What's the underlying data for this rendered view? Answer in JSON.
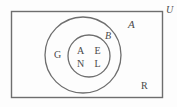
{
  "diagram": {
    "type": "euler-set-diagram",
    "universe": {
      "label": "U",
      "name": "universal-set-rectangle"
    },
    "sets": [
      {
        "id": "A",
        "label": "A",
        "shape": "circle",
        "style": "outer"
      },
      {
        "id": "B",
        "label": "B",
        "shape": "circle",
        "style": "inner"
      }
    ],
    "elements": {
      "inner_circle_b": [
        "A",
        "E",
        "N",
        "L"
      ],
      "between_a_and_b": [
        "G"
      ],
      "outside_circles": [
        "R"
      ]
    },
    "colors": {
      "stroke": "#6e6e6e",
      "text": "#4a4a4a",
      "background": "#fdfdfd"
    }
  }
}
